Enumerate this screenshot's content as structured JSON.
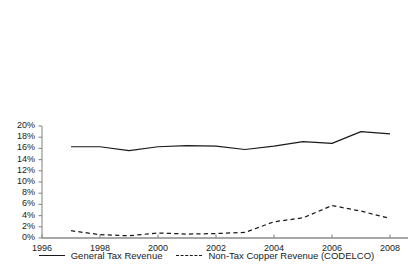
{
  "chart_data": {
    "type": "line",
    "title": "",
    "subtitle": "",
    "xlabel": "",
    "ylabel": "",
    "xlim": [
      1996,
      2009
    ],
    "ylim": [
      0,
      20
    ],
    "grid": false,
    "legend_position": "bottom",
    "x_ticks": [
      "1996",
      "1998",
      "2000",
      "2002",
      "2004",
      "2006",
      "2008"
    ],
    "x_tick_values": [
      1996,
      1998,
      2000,
      2002,
      2004,
      2006,
      2008
    ],
    "y_ticks": [
      "0%",
      "2%",
      "4%",
      "6%",
      "8%",
      "10%",
      "12%",
      "14%",
      "16%",
      "18%",
      "20%"
    ],
    "y_tick_values": [
      0,
      2,
      4,
      6,
      8,
      10,
      12,
      14,
      16,
      18,
      20
    ],
    "x": [
      1997,
      1998,
      1999,
      2000,
      2001,
      2002,
      2003,
      2004,
      2005,
      2006,
      2007,
      2008
    ],
    "series": [
      {
        "name": "General Tax Revenue",
        "style": "solid",
        "color": "#1a1a1a",
        "values": [
          16.3,
          16.3,
          15.6,
          16.3,
          16.5,
          16.4,
          15.8,
          16.4,
          17.2,
          16.9,
          19.0,
          18.6
        ]
      },
      {
        "name": "Non-Tax Copper Revenue (CODELCO)",
        "style": "dashed",
        "color": "#1a1a1a",
        "values": [
          1.3,
          0.6,
          0.4,
          0.9,
          0.7,
          0.8,
          1.0,
          2.9,
          3.6,
          5.8,
          4.8,
          3.5
        ]
      }
    ]
  },
  "legend": {
    "entries": [
      {
        "label": "General Tax Revenue",
        "style": "solid"
      },
      {
        "label": "Non-Tax Copper Revenue (CODELCO)",
        "style": "dashed"
      }
    ]
  },
  "axes": {
    "axis_color": "#8a8a8a",
    "tick_color": "#8a8a8a",
    "text_color": "#1a1a1a"
  }
}
